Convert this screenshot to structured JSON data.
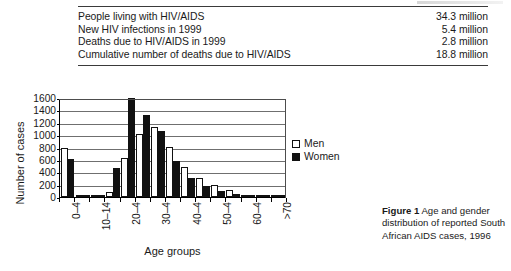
{
  "stats_table": {
    "rows": [
      {
        "label": "People living with HIV/AIDS",
        "value": "34.3 million"
      },
      {
        "label": "New HIV infections in 1999",
        "value": "5.4 million"
      },
      {
        "label": "Deaths due to HIV/AIDS in 1999",
        "value": "2.8 million"
      },
      {
        "label": "Cumulative number of deaths due to HIV/AIDS",
        "value": "18.8 million"
      }
    ]
  },
  "caption": {
    "number": "Figure 1",
    "text": " Age and gender distribution of reported South African AIDS cases, 1996"
  },
  "legend": {
    "position": "right",
    "items": [
      {
        "label": "Men",
        "swatch": "open-square",
        "color": "#ffffff"
      },
      {
        "label": "Women",
        "swatch": "filled-square",
        "color": "#111111"
      }
    ]
  },
  "chart_data": {
    "type": "bar",
    "title": "",
    "xlabel": "Age groups",
    "ylabel": "Number of cases",
    "ylim": [
      0,
      1600
    ],
    "yticks": [
      0,
      200,
      400,
      600,
      800,
      1000,
      1200,
      1400,
      1600
    ],
    "grid": true,
    "categories": [
      "0-4",
      "5-9",
      "10-14",
      "15-19",
      "20-24",
      "25-29",
      "30-34",
      "35-39",
      "40-44",
      "45-49",
      "50-54",
      "55-59",
      "60-64",
      "65-69",
      ">70"
    ],
    "tick_labels": [
      "0–4",
      "10–14",
      "20–4",
      "30–4",
      "40–4",
      "50–4",
      "60–4",
      ">70"
    ],
    "tick_label_categories": [
      "0-4",
      "10-14",
      "20-24",
      "30-34",
      "40-44",
      "50-54",
      "60-64",
      ">70"
    ],
    "series": [
      {
        "name": "Men",
        "values": [
          800,
          25,
          25,
          75,
          630,
          1020,
          1130,
          810,
          490,
          300,
          190,
          110,
          40,
          20,
          15
        ]
      },
      {
        "name": "Women",
        "values": [
          620,
          20,
          20,
          470,
          1600,
          1330,
          1060,
          590,
          300,
          175,
          105,
          45,
          20,
          10,
          8
        ]
      }
    ]
  }
}
